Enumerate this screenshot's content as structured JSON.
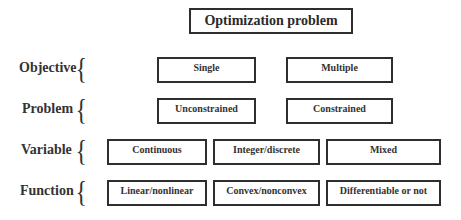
{
  "title": "Optimization problem",
  "rows": [
    {
      "label": "Objective",
      "options": [
        "Single",
        "Multiple"
      ]
    },
    {
      "label": "Problem",
      "options": [
        "Unconstrained",
        "Constrained"
      ]
    },
    {
      "label": "Variable",
      "options": [
        "Continuous",
        "Integer/discrete",
        "Mixed"
      ]
    },
    {
      "label": "Function",
      "options": [
        "Linear/nonlinear",
        "Convex/nonconvex",
        "Differentiable or not"
      ]
    }
  ],
  "brace_glyph": "{"
}
